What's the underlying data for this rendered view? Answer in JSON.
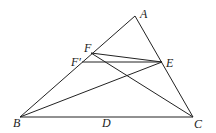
{
  "diagram": {
    "type": "geometry-triangle",
    "stroke_color": "#222222",
    "background": "#ffffff",
    "points": {
      "A": {
        "x": 135,
        "y": 16
      },
      "B": {
        "x": 20,
        "y": 117
      },
      "C": {
        "x": 193,
        "y": 117
      },
      "E": {
        "x": 162,
        "y": 62
      },
      "F": {
        "x": 91,
        "y": 53
      },
      "Fp": {
        "x": 82,
        "y": 62
      }
    },
    "labels": {
      "A": {
        "text": "A",
        "x": 140,
        "y": 18
      },
      "B": {
        "text": "B",
        "x": 13,
        "y": 127
      },
      "C": {
        "text": "C",
        "x": 194,
        "y": 128
      },
      "D": {
        "text": "D",
        "x": 102,
        "y": 127
      },
      "E": {
        "text": "E",
        "x": 166,
        "y": 67
      },
      "F": {
        "text": "F",
        "x": 84,
        "y": 52
      },
      "Fp": {
        "text": "F′",
        "x": 71,
        "y": 66
      }
    },
    "segments": [
      {
        "name": "AB",
        "from": "A",
        "to": "B"
      },
      {
        "name": "AC",
        "from": "A",
        "to": "C"
      },
      {
        "name": "BC",
        "from": "B",
        "to": "C"
      },
      {
        "name": "FE",
        "from": "F",
        "to": "E"
      },
      {
        "name": "FpE",
        "from": "Fp",
        "to": "E"
      },
      {
        "name": "FC",
        "from": "F",
        "to": "C"
      },
      {
        "name": "BE",
        "from": "B",
        "to": "E"
      }
    ]
  }
}
